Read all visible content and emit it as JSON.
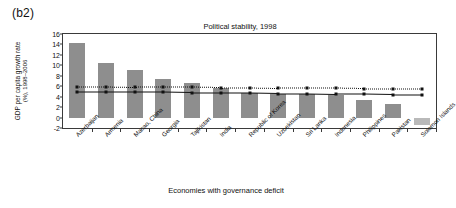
{
  "panel": {
    "label": "(b2)"
  },
  "axis": {
    "xlabel": "Economies with governance deficit",
    "ylabel_line1": "GDP per capita growth rate",
    "ylabel_line2": "(%), 1998–2006"
  },
  "colors": {
    "bar": "#8e8e8e",
    "bar_negative": "#b9b9b9",
    "line": "#111111",
    "frame": "#3a3a3a"
  },
  "chart_data": {
    "type": "bar",
    "title": "Political stability, 1998",
    "xlabel": "Economies with governance deficit",
    "ylabel": "GDP per capita growth rate (%), 1998–2006",
    "ylim": [
      -2,
      16
    ],
    "yticks": [
      -2,
      0,
      2,
      4,
      6,
      8,
      10,
      12,
      14,
      16
    ],
    "grid": false,
    "legend": "none",
    "categories": [
      "Azerbaijan",
      "Armenia",
      "Macao, China",
      "Georgia",
      "Tajikistan",
      "India",
      "Republic of Korea",
      "Uzbekistan",
      "Sri Lanka",
      "Indonesia",
      "Philippines",
      "Pakistan",
      "Solomon Islands"
    ],
    "values": [
      14.2,
      10.4,
      9.2,
      7.4,
      6.6,
      5.6,
      4.7,
      4.6,
      4.5,
      4.4,
      3.3,
      2.6,
      -1.5
    ],
    "series": [
      {
        "name": "bars",
        "type": "bar",
        "values": [
          14.2,
          10.4,
          9.2,
          7.4,
          6.6,
          5.6,
          4.7,
          4.6,
          4.5,
          4.4,
          3.3,
          2.6,
          -1.5
        ]
      },
      {
        "name": "dashed-reference",
        "type": "line",
        "style": "dotted",
        "marker": "square",
        "values": [
          5.9,
          5.9,
          5.8,
          5.8,
          5.8,
          5.7,
          5.7,
          5.6,
          5.6,
          5.6,
          5.5,
          5.5,
          5.5
        ]
      },
      {
        "name": "solid-reference",
        "type": "line",
        "style": "solid",
        "marker": "square",
        "values": [
          4.8,
          4.8,
          4.8,
          4.8,
          4.7,
          4.7,
          4.7,
          4.6,
          4.6,
          4.5,
          4.5,
          4.4,
          4.4
        ]
      }
    ]
  }
}
